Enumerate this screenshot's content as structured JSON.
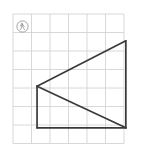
{
  "figure": {
    "background_color": "#ffffff",
    "grid": {
      "columns": 6,
      "rows": 7,
      "cell_size": 18.5,
      "origin_x": 13,
      "origin_y": 14,
      "line_color": "#d4d4d4",
      "line_width": 0.9,
      "visible": true
    },
    "shape": {
      "name": "triangle-pair",
      "stroke_color": "#3a3a3a",
      "stroke_width": 1.7,
      "fill": "none",
      "vertices": [
        {
          "label": "left",
          "col": 1.3,
          "row": 3.9
        },
        {
          "label": "top-right",
          "col": 6.1,
          "row": 1.45
        },
        {
          "label": "bottom-right",
          "col": 6.1,
          "row": 6.15
        }
      ],
      "segments": [
        {
          "name": "hypotenuse-upper",
          "from": "left",
          "to": "top-right"
        },
        {
          "name": "right-edge",
          "from": "top-right",
          "to": "bottom-right"
        },
        {
          "name": "hypotenuse-lower",
          "from": "left",
          "to": "bottom-right"
        },
        {
          "name": "left-edge",
          "from": "left",
          "to": "bottom-left"
        },
        {
          "name": "bottom-edge",
          "from": "bottom-left",
          "to": "bottom-right"
        }
      ],
      "extra_vertices": [
        {
          "label": "bottom-left",
          "col": 1.3,
          "row": 6.15
        }
      ]
    },
    "watermark": {
      "name": "circular-figure-logo",
      "glyph": "ⓐ",
      "center_x": 22.5,
      "center_y": 26.5,
      "radius": 5.6,
      "color": "#9a9a9a",
      "description": "small circled stylized figure mark"
    }
  },
  "chart_data": {
    "type": "scatter",
    "xlabel": "",
    "ylabel": "",
    "xlim": [
      0,
      6
    ],
    "ylim": [
      0,
      7
    ],
    "grid": true,
    "legend": "none",
    "series": [
      {
        "name": "triangle-outline",
        "x": [
          1.3,
          6.1,
          6.1,
          1.3
        ],
        "y": [
          3.9,
          1.45,
          6.15,
          3.9
        ]
      },
      {
        "name": "rectangle-partial",
        "x": [
          1.3,
          1.3,
          6.1
        ],
        "y": [
          3.9,
          6.15,
          6.15
        ]
      }
    ]
  }
}
